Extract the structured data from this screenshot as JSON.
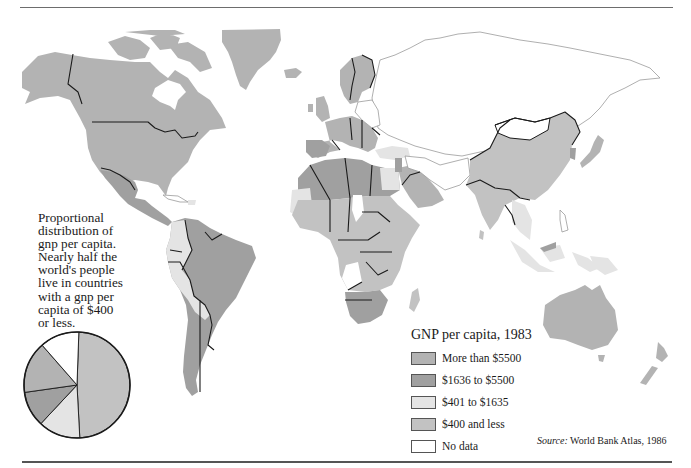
{
  "map": {
    "title": "GNP per capita, 1983",
    "colors": {
      "more_than_5500": "#b3b3b3",
      "1636_to_5500": "#a0a0a0",
      "401_to_1635": "#e4e4e4",
      "400_and_less": "#c2c2c2",
      "no_data": "#ffffff",
      "border": "#1a1a1a",
      "coast_outline": "#9a9a9a"
    },
    "regions": [
      {
        "name": "North America (USA, Canada)",
        "category": "More than $5500"
      },
      {
        "name": "Greenland",
        "category": "More than $5500"
      },
      {
        "name": "Mexico & Central America",
        "category": "$1636 to $5500"
      },
      {
        "name": "South America (Brazil, Argentina, Venezuela)",
        "category": "$1636 to $5500"
      },
      {
        "name": "Andean countries",
        "category": "$401 to $1635"
      },
      {
        "name": "Western Europe",
        "category": "More than $5500"
      },
      {
        "name": "USSR & Eastern Europe",
        "category": "No data"
      },
      {
        "name": "North Africa",
        "category": "$1636 to $5500"
      },
      {
        "name": "Sub-Saharan Africa",
        "category": "$400 and less"
      },
      {
        "name": "Southern Africa",
        "category": "$1636 to $5500"
      },
      {
        "name": "Arabian Peninsula",
        "category": "More than $5500"
      },
      {
        "name": "China & South Asia",
        "category": "$400 and less"
      },
      {
        "name": "Mongolia",
        "category": "No data"
      },
      {
        "name": "Japan",
        "category": "More than $5500"
      },
      {
        "name": "Southeast Asia / Indonesia",
        "category": "$401 to $1635"
      },
      {
        "name": "Australia & New Zealand",
        "category": "More than $5500"
      }
    ]
  },
  "caption": {
    "lines": [
      "Proportional",
      "distribution of",
      "gnp per capita.",
      "Nearly half the",
      "world's people",
      "live in countries",
      "with a gnp per",
      "capita of $400",
      "or less."
    ]
  },
  "legend": {
    "title": "GNP per capita, 1983",
    "items": [
      {
        "label": "More than $5500",
        "color": "#b3b3b3"
      },
      {
        "label": "$1636  to $5500",
        "color": "#a0a0a0"
      },
      {
        "label": "$401  to $1635",
        "color": "#e4e4e4"
      },
      {
        "label": "$400  and less",
        "color": "#c2c2c2"
      },
      {
        "label": "No data",
        "color": "#ffffff"
      }
    ]
  },
  "source": {
    "prefix": "Source:",
    "text": " World Bank Atlas, 1986"
  },
  "chart_data": {
    "type": "pie",
    "title": "Proportional distribution of gnp per capita",
    "categories": [
      "$400 and less",
      "$401 to $1635",
      "$1636 to $5500",
      "More than $5500",
      "No data"
    ],
    "values": [
      48.6,
      12.8,
      10.8,
      15.8,
      12.0
    ],
    "units": "percent of world population (estimated from slice angles)",
    "colors": [
      "#c2c2c2",
      "#e4e4e4",
      "#a0a0a0",
      "#b3b3b3",
      "#ffffff"
    ],
    "start_angle_deg": 2,
    "direction": "clockwise"
  }
}
